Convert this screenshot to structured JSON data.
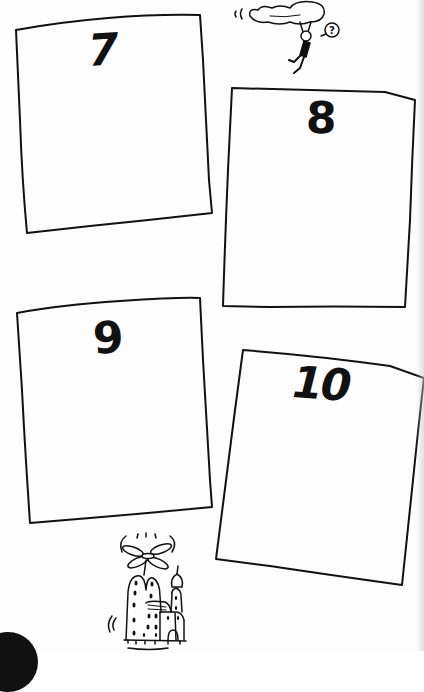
{
  "page": {
    "background": "#fdfdfd",
    "ink_color": "#111111"
  },
  "panels": [
    {
      "number": "7",
      "label": "Panel 7"
    },
    {
      "number": "8",
      "label": "Panel 8"
    },
    {
      "number": "9",
      "label": "Panel 9"
    },
    {
      "number": "10",
      "label": "Panel 10"
    }
  ],
  "illustrations": {
    "top": {
      "icon": "person-hanging-from-cloud-icon",
      "speech_bubble": "?"
    },
    "bottom": {
      "icon": "flying-building-helicopter-icon"
    }
  },
  "page_tab": {
    "icon": "page-number-tab-icon"
  }
}
